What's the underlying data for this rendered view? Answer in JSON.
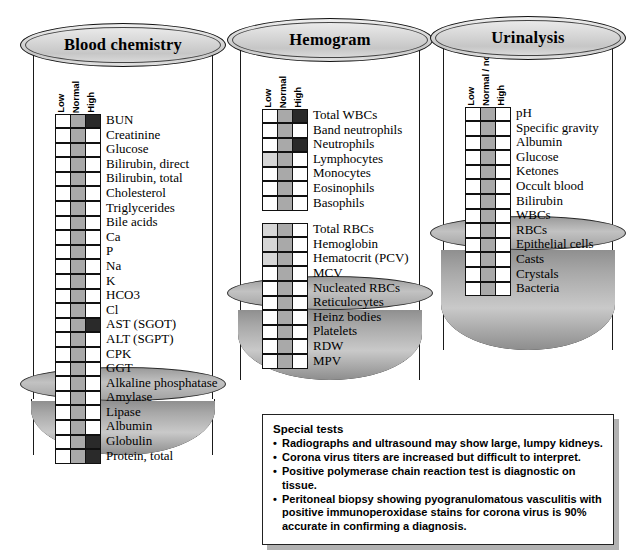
{
  "figure": {
    "column_headers_default": [
      "Low",
      "Normal",
      "High"
    ],
    "column_headers_urinalysis": [
      "Low",
      "Normal / none",
      "High"
    ]
  },
  "panels": [
    {
      "id": "blood-chemistry",
      "title": "Blood chemistry",
      "headers": [
        "Low",
        "Normal",
        "High"
      ],
      "groups": [
        {
          "rows": [
            {
              "label": "BUN",
              "low": "empty",
              "normal": "normal",
              "high": "dark"
            },
            {
              "label": "Creatinine",
              "low": "empty",
              "normal": "normal",
              "high": "empty"
            },
            {
              "label": "Glucose",
              "low": "empty",
              "normal": "normal",
              "high": "empty"
            },
            {
              "label": "Bilirubin, direct",
              "low": "empty",
              "normal": "normal",
              "high": "empty"
            },
            {
              "label": "Bilirubin, total",
              "low": "empty",
              "normal": "normal",
              "high": "empty"
            },
            {
              "label": "Cholesterol",
              "low": "empty",
              "normal": "normal",
              "high": "empty"
            },
            {
              "label": "Triglycerides",
              "low": "empty",
              "normal": "normal",
              "high": "empty"
            },
            {
              "label": "Bile acids",
              "low": "empty",
              "normal": "normal",
              "high": "empty"
            },
            {
              "label": "Ca",
              "low": "empty",
              "normal": "normal",
              "high": "empty"
            },
            {
              "label": "P",
              "low": "empty",
              "normal": "normal",
              "high": "empty"
            },
            {
              "label": "Na",
              "low": "empty",
              "normal": "normal",
              "high": "empty"
            },
            {
              "label": "K",
              "low": "empty",
              "normal": "normal",
              "high": "empty"
            },
            {
              "label": "HCO3",
              "low": "empty",
              "normal": "normal",
              "high": "empty"
            },
            {
              "label": "Cl",
              "low": "empty",
              "normal": "normal",
              "high": "empty"
            },
            {
              "label": "AST (SGOT)",
              "low": "empty",
              "normal": "normal",
              "high": "dark"
            },
            {
              "label": "ALT (SGPT)",
              "low": "empty",
              "normal": "normal",
              "high": "empty"
            },
            {
              "label": "CPK",
              "low": "empty",
              "normal": "normal",
              "high": "empty"
            },
            {
              "label": "GGT",
              "low": "empty",
              "normal": "normal",
              "high": "empty"
            },
            {
              "label": "Alkaline phosphatase",
              "low": "empty",
              "normal": "normal",
              "high": "empty"
            },
            {
              "label": "Amylase",
              "low": "empty",
              "normal": "normal",
              "high": "empty"
            },
            {
              "label": "Lipase",
              "low": "empty",
              "normal": "normal",
              "high": "empty"
            },
            {
              "label": "Albumin",
              "low": "empty",
              "normal": "normal",
              "high": "empty"
            },
            {
              "label": "Globulin",
              "low": "empty",
              "normal": "normal",
              "high": "dark"
            },
            {
              "label": "Protein, total",
              "low": "empty",
              "normal": "normal",
              "high": "dark"
            }
          ]
        }
      ]
    },
    {
      "id": "hemogram",
      "title": "Hemogram",
      "headers": [
        "Low",
        "Normal",
        "High"
      ],
      "groups": [
        {
          "rows": [
            {
              "label": "Total WBCs",
              "low": "empty",
              "normal": "normal",
              "high": "dark"
            },
            {
              "label": "Band neutrophils",
              "low": "empty",
              "normal": "normal",
              "high": "empty"
            },
            {
              "label": "Neutrophils",
              "low": "empty",
              "normal": "normal",
              "high": "dark"
            },
            {
              "label": "Lymphocytes",
              "low": "light",
              "normal": "normal",
              "high": "empty"
            },
            {
              "label": "Monocytes",
              "low": "empty",
              "normal": "normal",
              "high": "empty"
            },
            {
              "label": "Eosinophils",
              "low": "empty",
              "normal": "normal",
              "high": "empty"
            },
            {
              "label": "Basophils",
              "low": "empty",
              "normal": "normal",
              "high": "empty"
            }
          ]
        },
        {
          "rows": [
            {
              "label": "Total RBCs",
              "low": "light",
              "normal": "normal",
              "high": "empty"
            },
            {
              "label": "Hemoglobin",
              "low": "light",
              "normal": "normal",
              "high": "empty"
            },
            {
              "label": "Hematocrit (PCV)",
              "low": "light",
              "normal": "normal",
              "high": "empty"
            },
            {
              "label": "MCV",
              "low": "empty",
              "normal": "normal",
              "high": "empty"
            },
            {
              "label": "Nucleated RBCs",
              "low": "empty",
              "normal": "normal",
              "high": "empty"
            },
            {
              "label": "Reticulocytes",
              "low": "empty",
              "normal": "normal",
              "high": "empty"
            },
            {
              "label": "Heinz bodies",
              "low": "empty",
              "normal": "normal",
              "high": "empty"
            },
            {
              "label": "Platelets",
              "low": "empty",
              "normal": "normal",
              "high": "empty"
            },
            {
              "label": "RDW",
              "low": "empty",
              "normal": "normal",
              "high": "empty"
            },
            {
              "label": "MPV",
              "low": "empty",
              "normal": "normal",
              "high": "empty"
            }
          ]
        }
      ]
    },
    {
      "id": "urinalysis",
      "title": "Urinalysis",
      "headers": [
        "Low",
        "Normal / none",
        "High"
      ],
      "groups": [
        {
          "rows": [
            {
              "label": "pH",
              "low": "empty",
              "normal": "normal",
              "high": "empty"
            },
            {
              "label": "Specific gravity",
              "low": "empty",
              "normal": "normal",
              "high": "empty"
            },
            {
              "label": "Albumin",
              "low": "empty",
              "normal": "normal",
              "high": "empty"
            },
            {
              "label": "Glucose",
              "low": "empty",
              "normal": "normal",
              "high": "empty"
            },
            {
              "label": "Ketones",
              "low": "empty",
              "normal": "normal",
              "high": "empty"
            },
            {
              "label": "Occult blood",
              "low": "empty",
              "normal": "normal",
              "high": "empty"
            },
            {
              "label": "Bilirubin",
              "low": "empty",
              "normal": "normal",
              "high": "empty"
            },
            {
              "label": "WBCs",
              "low": "empty",
              "normal": "normal",
              "high": "empty"
            },
            {
              "label": "RBCs",
              "low": "empty",
              "normal": "normal",
              "high": "empty"
            },
            {
              "label": "Epithelial cells",
              "low": "empty",
              "normal": "normal",
              "high": "empty"
            },
            {
              "label": "Casts",
              "low": "empty",
              "normal": "normal",
              "high": "empty"
            },
            {
              "label": "Crystals",
              "low": "empty",
              "normal": "normal",
              "high": "empty"
            },
            {
              "label": "Bacteria",
              "low": "empty",
              "normal": "normal",
              "high": "empty"
            }
          ]
        }
      ]
    }
  ],
  "special_tests": {
    "title": "Special tests",
    "items": [
      "Radiographs and ultrasound may show large, lumpy kidneys.",
      "Corona virus titers are increased but difficult to interpret.",
      "Positive polymerase chain reaction test is diagnostic on tissue.",
      "Peritoneal biopsy showing pyogranulomatous vasculitis with positive immunoperoxidase stains for corona virus is 90% accurate in confirming a diagnosis."
    ]
  }
}
